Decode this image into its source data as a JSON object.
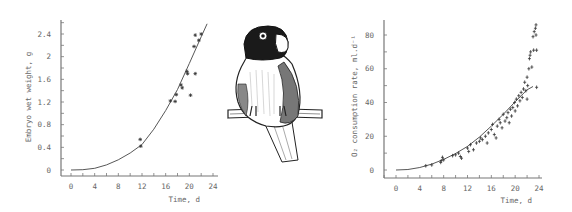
{
  "chart_data": [
    {
      "type": "scatter",
      "title": "",
      "xlabel": "Time, d",
      "ylabel": "Embryo wet weight, g",
      "xlim": [
        0,
        24
      ],
      "ylim": [
        0,
        2.4
      ],
      "x_ticks": [
        "0",
        "4",
        "8",
        "12",
        "16",
        "20",
        "24"
      ],
      "y_ticks": [
        "0",
        "0.4",
        "0.8",
        "1.2",
        "1.6",
        "2",
        "2.4"
      ],
      "grid": false,
      "series": [
        {
          "name": "observed",
          "marker": "*",
          "points": [
            [
              11.7,
              0.54
            ],
            [
              11.8,
              0.42
            ],
            [
              16.8,
              1.22
            ],
            [
              17.6,
              1.21
            ],
            [
              17.8,
              1.33
            ],
            [
              18.6,
              1.5
            ],
            [
              18.8,
              1.45
            ],
            [
              19.6,
              1.74
            ],
            [
              19.7,
              1.7
            ],
            [
              20.2,
              1.32
            ],
            [
              20.8,
              2.18
            ],
            [
              21.0,
              2.38
            ],
            [
              21.0,
              1.7
            ],
            [
              21.6,
              2.29
            ],
            [
              22.0,
              2.4
            ]
          ]
        },
        {
          "name": "fitted curve",
          "type": "line",
          "points": [
            [
              0,
              0
            ],
            [
              2,
              0.005
            ],
            [
              4,
              0.03
            ],
            [
              6,
              0.09
            ],
            [
              8,
              0.18
            ],
            [
              10,
              0.3
            ],
            [
              12,
              0.45
            ],
            [
              14,
              0.72
            ],
            [
              16,
              1.05
            ],
            [
              18,
              1.42
            ],
            [
              20,
              1.88
            ],
            [
              22,
              2.35
            ],
            [
              23,
              2.58
            ]
          ]
        }
      ]
    },
    {
      "type": "scatter",
      "title": "",
      "xlabel": "Time, d",
      "ylabel": "O₂ consumption rate, ml.d⁻¹",
      "xlim": [
        0,
        24
      ],
      "ylim": [
        0,
        80
      ],
      "x_ticks": [
        "0",
        "4",
        "8",
        "12",
        "16",
        "20",
        "24"
      ],
      "y_ticks": [
        "0",
        "20",
        "40",
        "60",
        "80"
      ],
      "grid": false,
      "series": [
        {
          "name": "observed",
          "marker": "+",
          "points": [
            [
              5,
              2.5
            ],
            [
              6,
              3
            ],
            [
              7.5,
              4.5
            ],
            [
              7.6,
              5.5
            ],
            [
              7.8,
              7.5
            ],
            [
              8,
              6
            ],
            [
              9.5,
              8.5
            ],
            [
              10,
              9
            ],
            [
              10.5,
              10
            ],
            [
              10.8,
              8
            ],
            [
              11,
              7
            ],
            [
              12,
              13
            ],
            [
              12.2,
              11
            ],
            [
              12.5,
              15
            ],
            [
              13,
              12
            ],
            [
              13.5,
              16
            ],
            [
              14,
              17
            ],
            [
              14.2,
              19
            ],
            [
              14.5,
              18
            ],
            [
              15,
              20
            ],
            [
              15.3,
              16
            ],
            [
              15.5,
              22
            ],
            [
              16,
              24
            ],
            [
              16.2,
              27
            ],
            [
              16.5,
              21
            ],
            [
              16.8,
              19
            ],
            [
              17,
              26
            ],
            [
              17.3,
              30
            ],
            [
              17.5,
              28
            ],
            [
              17.8,
              25
            ],
            [
              18,
              33
            ],
            [
              18.3,
              29
            ],
            [
              18.6,
              31
            ],
            [
              18.8,
              34
            ],
            [
              19,
              28
            ],
            [
              19.2,
              36
            ],
            [
              19.4,
              32
            ],
            [
              19.6,
              37
            ],
            [
              19.9,
              40
            ],
            [
              20,
              35
            ],
            [
              20.2,
              42
            ],
            [
              20.4,
              38
            ],
            [
              20.6,
              44
            ],
            [
              20.8,
              41
            ],
            [
              21,
              46
            ],
            [
              21.2,
              43
            ],
            [
              21.4,
              48
            ],
            [
              21.6,
              52
            ],
            [
              21.8,
              47
            ],
            [
              22,
              42
            ],
            [
              22,
              55
            ],
            [
              22.1,
              50
            ],
            [
              22.3,
              60
            ],
            [
              22.4,
              66
            ],
            [
              22.5,
              68
            ],
            [
              22.6,
              70
            ],
            [
              22.8,
              61
            ],
            [
              23,
              79
            ],
            [
              23.1,
              71
            ],
            [
              23.2,
              82
            ],
            [
              23.4,
              84
            ],
            [
              23.5,
              86
            ],
            [
              23.5,
              80
            ],
            [
              23.6,
              71
            ],
            [
              23.6,
              49
            ]
          ]
        },
        {
          "name": "fitted curve",
          "type": "line",
          "points": [
            [
              0,
              0
            ],
            [
              2,
              0.3
            ],
            [
              4,
              1.5
            ],
            [
              6,
              3.5
            ],
            [
              8,
              6.3
            ],
            [
              10,
              9.8
            ],
            [
              12,
              14
            ],
            [
              14,
              19.5
            ],
            [
              16,
              26
            ],
            [
              18,
              33
            ],
            [
              20,
              40.5
            ],
            [
              21,
              44
            ],
            [
              22,
              47.5
            ],
            [
              23,
              49.5
            ]
          ]
        }
      ]
    }
  ],
  "illustration": {
    "subject": "lovebird-perched-on-branch"
  }
}
